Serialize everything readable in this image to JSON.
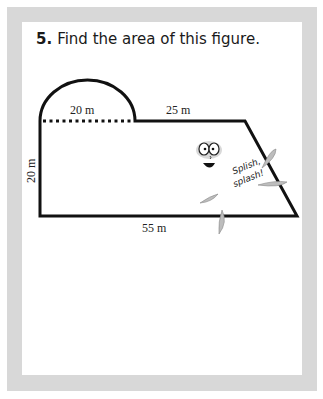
{
  "problem": {
    "number": "5.",
    "text": "Find the area of this figure."
  },
  "figure": {
    "labels": {
      "semicircle_diameter": "20 m",
      "top_right": "25 m",
      "left_height": "20 m",
      "bottom": "55 m"
    },
    "mascot": {
      "caption_line1": "Splish,",
      "caption_line2": "splash!"
    }
  },
  "colors": {
    "frame": "#d8d8d8",
    "panel": "#ffffff",
    "ink": "#111111"
  }
}
